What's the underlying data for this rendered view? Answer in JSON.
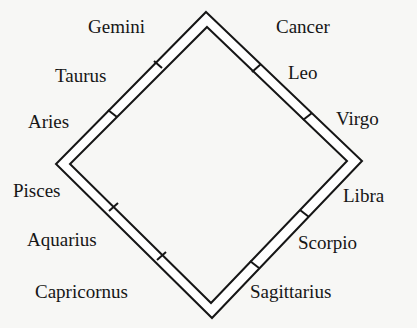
{
  "diagram": {
    "title": "",
    "colors": {
      "ink": "#161616",
      "band_fill": "#ffffff",
      "background": "#f7f7f5"
    },
    "shape": "diamond-band",
    "signs": {
      "gemini": "Gemini",
      "cancer": "Cancer",
      "taurus": "Taurus",
      "leo": "Leo",
      "aries": "Aries",
      "virgo": "Virgo",
      "pisces": "Pisces",
      "libra": "Libra",
      "aquarius": "Aquarius",
      "scorpio": "Scorpio",
      "capricornus": "Capricornus",
      "sagittarius": "Sagittarius"
    },
    "order": [
      "Aries",
      "Taurus",
      "Gemini",
      "Cancer",
      "Leo",
      "Virgo",
      "Libra",
      "Scorpio",
      "Sagittarius",
      "Capricornus",
      "Aquarius",
      "Pisces"
    ],
    "sides": {
      "upper_left": [
        "Aries",
        "Taurus",
        "Gemini"
      ],
      "upper_right": [
        "Cancer",
        "Leo",
        "Virgo"
      ],
      "lower_right": [
        "Libra",
        "Scorpio",
        "Sagittarius"
      ],
      "lower_left": [
        "Capricornus",
        "Aquarius",
        "Pisces"
      ]
    }
  }
}
